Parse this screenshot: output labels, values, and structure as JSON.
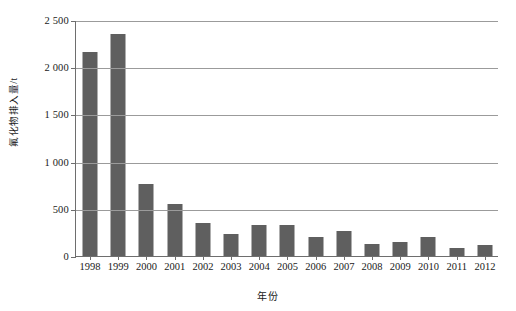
{
  "chart_data": {
    "type": "bar",
    "title": "",
    "xlabel": "年份",
    "ylabel": "氟化物排入量/t",
    "categories": [
      "1998",
      "1999",
      "2000",
      "2001",
      "2002",
      "2003",
      "2004",
      "2005",
      "2006",
      "2007",
      "2008",
      "2009",
      "2010",
      "2011",
      "2012"
    ],
    "values": [
      2160,
      2350,
      760,
      550,
      345,
      235,
      330,
      325,
      205,
      265,
      130,
      145,
      205,
      90,
      115
    ],
    "ylim": [
      0,
      2500
    ],
    "yticks": [
      0,
      500,
      1000,
      1500,
      2000,
      2500
    ],
    "ytick_labels": [
      "0",
      "500",
      "1 000",
      "1 500",
      "2 000",
      "2 500"
    ],
    "grid": true,
    "legend": false,
    "series_color": "#5f5f5f",
    "axis_color": "#6e6e6e",
    "grid_color": "#9b9b9b"
  }
}
